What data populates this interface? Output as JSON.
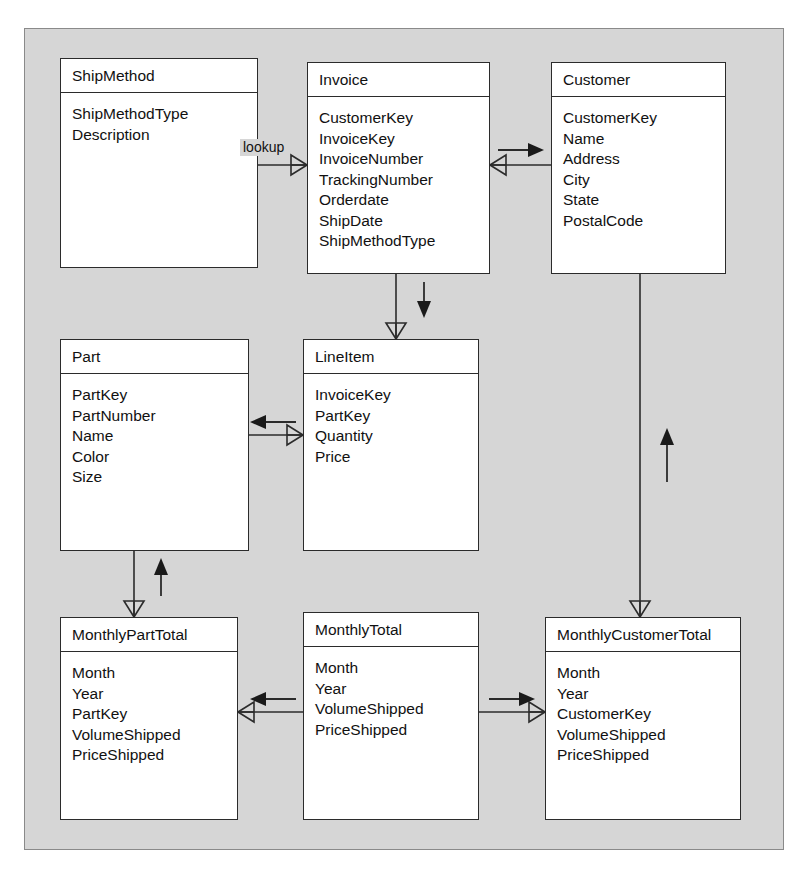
{
  "diagram": {
    "type": "entity-relationship-diagram",
    "notation": "crow's foot",
    "background_color": "#d6d6d6",
    "entity_fill_color": "#ffffff",
    "line_color": "#2b2b2b",
    "entities": [
      {
        "id": "shipmethod",
        "name": "ShipMethod",
        "attributes": [
          "ShipMethodType",
          "Description"
        ]
      },
      {
        "id": "invoice",
        "name": "Invoice",
        "attributes": [
          "CustomerKey",
          "InvoiceKey",
          "InvoiceNumber",
          "TrackingNumber",
          "Orderdate",
          "ShipDate",
          "ShipMethodType"
        ]
      },
      {
        "id": "customer",
        "name": "Customer",
        "attributes": [
          "CustomerKey",
          "Name",
          "Address",
          "City",
          "State",
          "PostalCode"
        ]
      },
      {
        "id": "part",
        "name": "Part",
        "attributes": [
          "PartKey",
          "PartNumber",
          "Name",
          "Color",
          "Size"
        ]
      },
      {
        "id": "lineitem",
        "name": "LineItem",
        "attributes": [
          "InvoiceKey",
          "PartKey",
          "Quantity",
          "Price"
        ]
      },
      {
        "id": "monthlyparttotal",
        "name": "MonthlyPartTotal",
        "attributes": [
          "Month",
          "Year",
          "PartKey",
          "VolumeShipped",
          "PriceShipped"
        ]
      },
      {
        "id": "monthlytotal",
        "name": "MonthlyTotal",
        "attributes": [
          "Month",
          "Year",
          "VolumeShipped",
          "PriceShipped"
        ]
      },
      {
        "id": "monthlycustomertotal",
        "name": "MonthlyCustomerTotal",
        "attributes": [
          "Month",
          "Year",
          "CustomerKey",
          "VolumeShipped",
          "PriceShipped"
        ]
      }
    ],
    "relationships": [
      {
        "id": "shipmethod-invoice",
        "from": "shipmethod",
        "to": "invoice",
        "label": "lookup",
        "arrow_direction": "none",
        "crowsfoot_at": "invoice"
      },
      {
        "id": "invoice-customer",
        "from": "invoice",
        "to": "customer",
        "label": "",
        "arrow_direction": "right",
        "crowsfoot_at": "invoice"
      },
      {
        "id": "invoice-lineitem",
        "from": "invoice",
        "to": "lineitem",
        "label": "",
        "arrow_direction": "down",
        "crowsfoot_at": "lineitem"
      },
      {
        "id": "lineitem-part",
        "from": "lineitem",
        "to": "part",
        "label": "",
        "arrow_direction": "left",
        "crowsfoot_at": "lineitem"
      },
      {
        "id": "customer-monthlycustomertotal",
        "from": "monthlycustomertotal",
        "to": "customer",
        "label": "",
        "arrow_direction": "up",
        "crowsfoot_at": "monthlycustomertotal"
      },
      {
        "id": "monthlyparttotal-part",
        "from": "monthlyparttotal",
        "to": "part",
        "label": "",
        "arrow_direction": "up",
        "crowsfoot_at": "monthlyparttotal"
      },
      {
        "id": "monthlytotal-monthlyparttotal",
        "from": "monthlytotal",
        "to": "monthlyparttotal",
        "label": "",
        "arrow_direction": "left",
        "crowsfoot_at": "monthlyparttotal"
      },
      {
        "id": "monthlytotal-monthlycustomertotal",
        "from": "monthlytotal",
        "to": "monthlycustomertotal",
        "label": "",
        "arrow_direction": "right",
        "crowsfoot_at": "monthlycustomertotal"
      }
    ]
  }
}
